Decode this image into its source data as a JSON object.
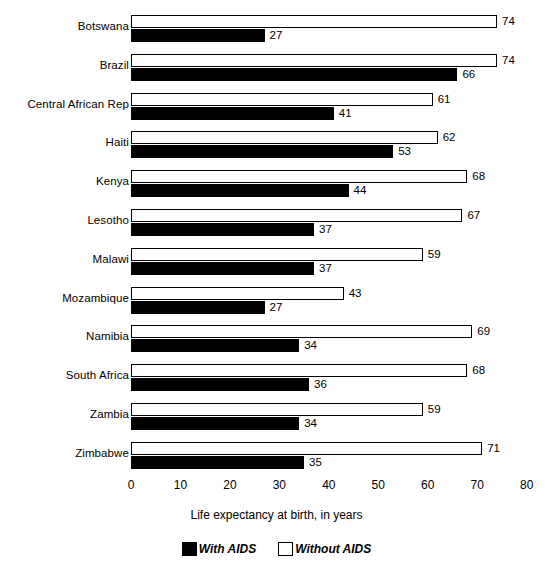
{
  "chart_data": {
    "type": "bar",
    "orientation": "horizontal",
    "title": "",
    "xlabel": "Life expectancy at birth, in years",
    "ylabel": "",
    "xlim": [
      0,
      80
    ],
    "xticks": [
      0,
      10,
      20,
      30,
      40,
      50,
      60,
      70,
      80
    ],
    "grid": false,
    "legend_position": "bottom",
    "categories": [
      "Botswana",
      "Brazil",
      "Central African Rep",
      "Haiti",
      "Kenya",
      "Lesotho",
      "Malawi",
      "Mozambique",
      "Namibia",
      "South Africa",
      "Zambia",
      "Zimbabwe"
    ],
    "series": [
      {
        "name": "Without AIDS",
        "color": "#ffffff",
        "edge_color": "#000000",
        "values": [
          74,
          74,
          61,
          62,
          68,
          67,
          59,
          43,
          69,
          68,
          59,
          71
        ]
      },
      {
        "name": "With AIDS",
        "color": "#000000",
        "edge_color": "#000000",
        "values": [
          27,
          66,
          41,
          53,
          44,
          37,
          37,
          27,
          34,
          36,
          34,
          35
        ]
      }
    ]
  },
  "legend": {
    "items": [
      {
        "label": "With AIDS",
        "swatch": "filled-square-icon"
      },
      {
        "label": "Without AIDS",
        "swatch": "hollow-square-icon"
      }
    ]
  }
}
